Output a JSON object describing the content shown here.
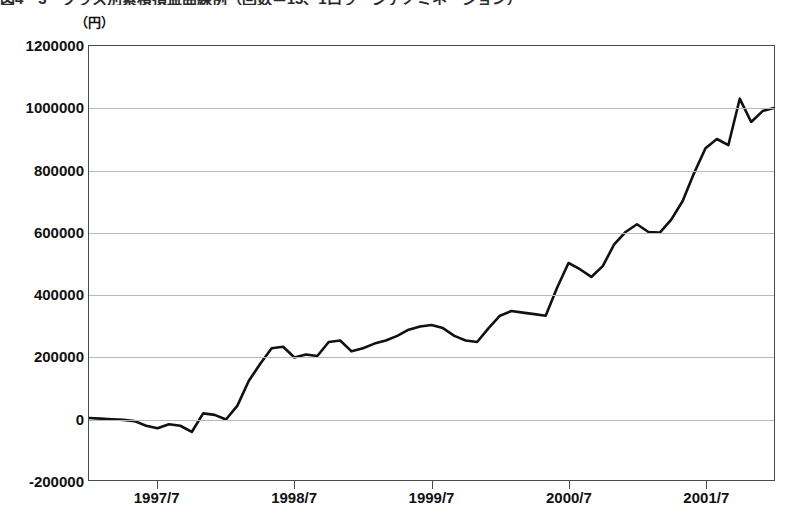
{
  "figure": {
    "title_clipped": "図4－3　クラス別累積損益曲線例（回数＝13、1口ラージデノミネーション）",
    "unit_label": "（円）"
  },
  "chart_data": {
    "type": "line",
    "title": "図4－3　クラス別累積損益曲線例（回数＝13、1口ラージデノミネーション）",
    "xlabel": "",
    "ylabel": "（円）",
    "ylim": [
      -200000,
      1200000
    ],
    "ytick_labels": [
      "1200000",
      "1000000",
      "800000",
      "600000",
      "400000",
      "200000",
      "0",
      "-200000"
    ],
    "ytick_values": [
      1200000,
      1000000,
      800000,
      600000,
      400000,
      200000,
      0,
      -200000
    ],
    "xtick_labels": [
      "1997/7",
      "1998/7",
      "1999/7",
      "2000/7",
      "2001/7"
    ],
    "xtick_x": [
      "1997-07",
      "1998-07",
      "1999-07",
      "2000-07",
      "2001-07"
    ],
    "grid": true,
    "legend": "none",
    "line_color": "#111111",
    "line_width": 2.6,
    "x": [
      "1997-01",
      "1997-02",
      "1997-03",
      "1997-04",
      "1997-05",
      "1997-06",
      "1997-07",
      "1997-08",
      "1997-09",
      "1997-10",
      "1997-11",
      "1997-12",
      "1998-01",
      "1998-02",
      "1998-03",
      "1998-04",
      "1998-05",
      "1998-06",
      "1998-07",
      "1998-08",
      "1998-09",
      "1998-10",
      "1998-11",
      "1998-12",
      "1999-01",
      "1999-02",
      "1999-03",
      "1999-04",
      "1999-05",
      "1999-06",
      "1999-07",
      "1999-08",
      "1999-09",
      "1999-10",
      "1999-11",
      "1999-12",
      "2000-01",
      "2000-02",
      "2000-03",
      "2000-04",
      "2000-05",
      "2000-06",
      "2000-07",
      "2000-08",
      "2000-09",
      "2000-10",
      "2000-11",
      "2000-12",
      "2001-01",
      "2001-02",
      "2001-03",
      "2001-04",
      "2001-05",
      "2001-06",
      "2001-07",
      "2001-08",
      "2001-09",
      "2001-10",
      "2001-11",
      "2001-12",
      "2002-01"
    ],
    "values": [
      0,
      -2000,
      -4000,
      -6000,
      -10000,
      -25000,
      -33000,
      -20000,
      -25000,
      -45000,
      15000,
      10000,
      -5000,
      40000,
      120000,
      175000,
      225000,
      230000,
      195000,
      205000,
      200000,
      245000,
      250000,
      215000,
      225000,
      240000,
      250000,
      265000,
      285000,
      295000,
      300000,
      290000,
      265000,
      250000,
      245000,
      290000,
      330000,
      345000,
      340000,
      335000,
      330000,
      420000,
      500000,
      480000,
      455000,
      490000,
      560000,
      600000,
      625000,
      600000,
      598000,
      640000,
      700000,
      790000,
      870000,
      900000,
      880000,
      1030000,
      955000,
      990000,
      1000000
    ]
  }
}
